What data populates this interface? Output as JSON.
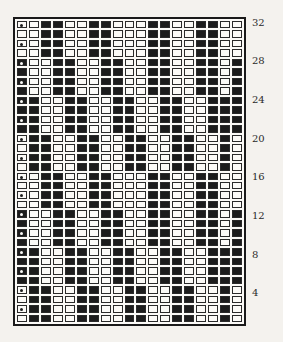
{
  "diagram": {
    "type": "weave-draft-grid",
    "columns": 19,
    "rows": 32,
    "row_labels": [
      {
        "label": "32",
        "row": 32
      },
      {
        "label": "28",
        "row": 28
      },
      {
        "label": "24",
        "row": 24
      },
      {
        "label": "20",
        "row": 20
      },
      {
        "label": "16",
        "row": 16
      },
      {
        "label": "12",
        "row": 12
      },
      {
        "label": "8",
        "row": 8
      },
      {
        "label": "4",
        "row": 4
      }
    ],
    "pattern_top_to_bottom": [
      "0011001100011001100",
      "0011001100011001100",
      "0011001100011001100",
      "0011001100011001100",
      "1001100110011001101",
      "1001100110011001101",
      "1001100110011001101",
      "1001100110011001101",
      "1100110011001100111",
      "1100110011001100111",
      "1100110011001100111",
      "1100110011001100111",
      "0110011001100110010",
      "0110011001100110010",
      "0110011001100110010",
      "0110011001100110010",
      "0011001100011001100",
      "0011001100011001100",
      "0011001100011001100",
      "0011001100011001100",
      "1001100110011001101",
      "1001100110011001101",
      "1001100110011001101",
      "1001100110011001101",
      "1100110011001100111",
      "1100110011001100111",
      "1100110011001100111",
      "1100110011001100111",
      "0110011001100110010",
      "0110011001100110010",
      "0110011001100110010",
      "0110011001100110010"
    ],
    "dot_rows_col1_top_to_bottom": [
      1,
      3,
      5,
      7,
      9,
      11,
      13,
      15,
      17,
      19,
      21,
      23,
      25,
      27,
      29,
      31
    ],
    "colors": {
      "filled": "#1c1c1c",
      "empty": "#fbfaf7",
      "border": "#2a2a2a"
    }
  }
}
